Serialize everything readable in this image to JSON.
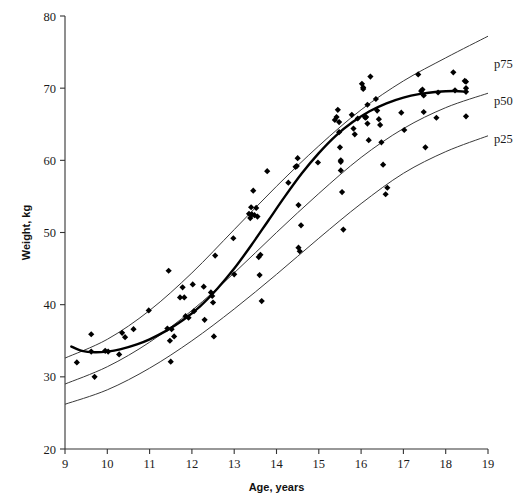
{
  "chart_data": {
    "type": "scatter",
    "title": "",
    "xlabel": "Age, years",
    "ylabel": "Weight, kg",
    "xlim": [
      9,
      19
    ],
    "ylim": [
      20,
      80
    ],
    "xticks": [
      9,
      10,
      11,
      12,
      13,
      14,
      15,
      16,
      17,
      18,
      19
    ],
    "yticks": [
      20,
      30,
      40,
      50,
      60,
      70,
      80
    ],
    "grid": false,
    "legend_position": "right-inline",
    "annotations": [
      {
        "text": "p75",
        "x": 19.25,
        "y": 72.0
      },
      {
        "text": "p50",
        "x": 19.25,
        "y": 67.5
      },
      {
        "text": "p25",
        "x": 19.25,
        "y": 62.5
      }
    ],
    "series": [
      {
        "name": "observations",
        "type": "scatter",
        "marker": "diamond",
        "color": "#000000",
        "points": [
          [
            9.28,
            32.0
          ],
          [
            9.62,
            35.9
          ],
          [
            9.62,
            33.5
          ],
          [
            9.7,
            30.0
          ],
          [
            9.95,
            33.6
          ],
          [
            10.02,
            33.5
          ],
          [
            10.28,
            33.1
          ],
          [
            10.35,
            36.1
          ],
          [
            10.42,
            35.5
          ],
          [
            10.62,
            36.6
          ],
          [
            10.98,
            39.2
          ],
          [
            11.42,
            36.7
          ],
          [
            11.45,
            44.7
          ],
          [
            11.48,
            35.0
          ],
          [
            11.5,
            32.1
          ],
          [
            11.52,
            36.6
          ],
          [
            11.58,
            35.6
          ],
          [
            11.72,
            41.0
          ],
          [
            11.78,
            42.4
          ],
          [
            11.82,
            41.0
          ],
          [
            11.85,
            38.4
          ],
          [
            11.92,
            38.2
          ],
          [
            12.02,
            42.8
          ],
          [
            12.05,
            39.1
          ],
          [
            12.28,
            42.5
          ],
          [
            12.3,
            37.9
          ],
          [
            12.45,
            41.7
          ],
          [
            12.48,
            41.2
          ],
          [
            12.5,
            40.3
          ],
          [
            12.52,
            35.6
          ],
          [
            12.55,
            46.8
          ],
          [
            12.98,
            49.2
          ],
          [
            13.0,
            44.2
          ],
          [
            13.35,
            52.6
          ],
          [
            13.38,
            52.0
          ],
          [
            13.4,
            53.5
          ],
          [
            13.42,
            52.5
          ],
          [
            13.45,
            55.8
          ],
          [
            13.48,
            52.4
          ],
          [
            13.52,
            53.4
          ],
          [
            13.55,
            52.2
          ],
          [
            13.58,
            46.6
          ],
          [
            13.6,
            44.1
          ],
          [
            13.62,
            46.9
          ],
          [
            13.65,
            40.5
          ],
          [
            13.78,
            58.5
          ],
          [
            14.28,
            56.9
          ],
          [
            14.45,
            59.1
          ],
          [
            14.48,
            59.2
          ],
          [
            14.5,
            60.3
          ],
          [
            14.52,
            53.8
          ],
          [
            14.52,
            47.9
          ],
          [
            14.55,
            47.4
          ],
          [
            14.58,
            51.0
          ],
          [
            14.98,
            59.7
          ],
          [
            15.38,
            65.6
          ],
          [
            15.42,
            66.0
          ],
          [
            15.45,
            67.0
          ],
          [
            15.48,
            65.3
          ],
          [
            15.48,
            63.9
          ],
          [
            15.5,
            61.8
          ],
          [
            15.52,
            60.0
          ],
          [
            15.52,
            59.8
          ],
          [
            15.52,
            58.6
          ],
          [
            15.55,
            55.6
          ],
          [
            15.58,
            50.4
          ],
          [
            15.78,
            66.3
          ],
          [
            15.82,
            64.4
          ],
          [
            15.85,
            63.6
          ],
          [
            15.92,
            65.8
          ],
          [
            16.02,
            70.6
          ],
          [
            16.05,
            70.1
          ],
          [
            16.05,
            69.9
          ],
          [
            16.08,
            66.1
          ],
          [
            16.1,
            65.9
          ],
          [
            16.12,
            66.0
          ],
          [
            16.15,
            67.7
          ],
          [
            16.15,
            65.1
          ],
          [
            16.18,
            62.8
          ],
          [
            16.22,
            71.6
          ],
          [
            16.35,
            68.5
          ],
          [
            16.38,
            66.9
          ],
          [
            16.42,
            65.7
          ],
          [
            16.45,
            64.9
          ],
          [
            16.48,
            62.5
          ],
          [
            16.52,
            59.4
          ],
          [
            16.58,
            55.3
          ],
          [
            16.62,
            56.2
          ],
          [
            16.95,
            66.6
          ],
          [
            17.02,
            64.2
          ],
          [
            17.35,
            71.9
          ],
          [
            17.42,
            69.6
          ],
          [
            17.45,
            69.8
          ],
          [
            17.48,
            69.0
          ],
          [
            17.48,
            66.7
          ],
          [
            17.52,
            61.8
          ],
          [
            17.78,
            65.9
          ],
          [
            17.82,
            69.4
          ],
          [
            18.18,
            72.2
          ],
          [
            18.22,
            69.7
          ],
          [
            18.45,
            71.0
          ],
          [
            18.48,
            70.9
          ],
          [
            18.48,
            70.0
          ],
          [
            18.48,
            69.5
          ],
          [
            18.48,
            66.1
          ]
        ]
      },
      {
        "name": "p75",
        "type": "line",
        "label": "p75",
        "color": "#3a3a3a",
        "x": [
          9,
          10,
          11,
          12,
          13,
          14,
          15,
          16,
          17,
          18,
          19
        ],
        "y": [
          32.6,
          35.2,
          39.2,
          44.4,
          50.4,
          56.4,
          62.0,
          67.0,
          71.0,
          74.2,
          77.2
        ]
      },
      {
        "name": "p50",
        "type": "line",
        "label": "p50",
        "color": "#3a3a3a",
        "x": [
          9,
          10,
          11,
          12,
          13,
          14,
          15,
          16,
          17,
          18,
          19
        ],
        "y": [
          29.0,
          31.4,
          34.8,
          39.2,
          44.4,
          50.0,
          55.4,
          60.4,
          64.4,
          67.3,
          69.3
        ]
      },
      {
        "name": "p25",
        "type": "line",
        "label": "p25",
        "color": "#3a3a3a",
        "x": [
          9,
          10,
          11,
          12,
          13,
          14,
          15,
          16,
          17,
          18,
          19
        ],
        "y": [
          26.2,
          28.2,
          31.2,
          35.0,
          39.4,
          44.2,
          49.2,
          54.0,
          58.2,
          61.2,
          63.4
        ]
      },
      {
        "name": "fitted-mean",
        "type": "line",
        "color": "#000000",
        "emphasis": true,
        "x": [
          9.15,
          9.4,
          9.7,
          10.0,
          10.3,
          10.7,
          11.0,
          11.4,
          11.8,
          12.2,
          12.6,
          13.0,
          13.4,
          13.8,
          14.2,
          14.6,
          15.0,
          15.4,
          15.8,
          16.2,
          16.6,
          17.0,
          17.4,
          17.8,
          18.2,
          18.5
        ],
        "y": [
          34.2,
          33.6,
          33.4,
          33.5,
          33.8,
          34.5,
          35.2,
          36.4,
          37.9,
          39.8,
          42.2,
          45.0,
          48.2,
          51.6,
          55.0,
          58.2,
          61.0,
          63.4,
          65.3,
          66.8,
          67.9,
          68.7,
          69.2,
          69.5,
          69.6,
          69.5
        ]
      }
    ]
  },
  "figure": {
    "background_color": "#ffffff",
    "axis_color": "#333333",
    "point_color": "#000000",
    "curve_color": "#3a3a3a",
    "fit_color": "#000000"
  }
}
